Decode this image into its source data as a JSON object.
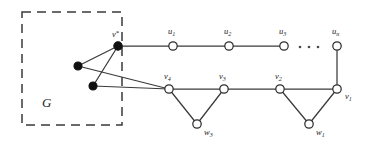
{
  "figure": {
    "background_color": "#ffffff",
    "stroke_color": "#3a3a3a",
    "filled_node_color": "#111111",
    "open_node_color": "#ffffff"
  },
  "box": {
    "label": "G",
    "style": "dashed",
    "x": 22,
    "y": 12,
    "width": 100,
    "height": 113
  },
  "labels": {
    "v_star": "v",
    "v_star_sup": "*",
    "u1": "u",
    "u1_sub": "1",
    "u2": "u",
    "u2_sub": "2",
    "u3": "u",
    "u3_sub": "3",
    "un": "u",
    "un_sub": "n",
    "v1": "v",
    "v1_sub": "1",
    "v2": "v",
    "v2_sub": "2",
    "v3": "v",
    "v3_sub": "3",
    "v4": "v",
    "v4_sub": "4",
    "w1": "w",
    "w1_sub": "1",
    "w3": "w",
    "w3_sub": "3",
    "ellipsis": "..."
  },
  "graph_data": {
    "type": "node-link-diagram",
    "nodes": [
      {
        "id": "g1",
        "label": "",
        "x": 78,
        "y": 66,
        "fill": "solid",
        "r": 4.0
      },
      {
        "id": "g2",
        "label": "",
        "x": 93,
        "y": 86,
        "fill": "solid",
        "r": 4.0
      },
      {
        "id": "v_star",
        "label": "v*",
        "x": 118,
        "y": 46,
        "fill": "solid",
        "r": 4.2
      },
      {
        "id": "u1",
        "label": "u1",
        "x": 173,
        "y": 46,
        "fill": "open",
        "r": 4.2
      },
      {
        "id": "u2",
        "label": "u2",
        "x": 229,
        "y": 46,
        "fill": "open",
        "r": 4.2
      },
      {
        "id": "u3",
        "label": "u3",
        "x": 284,
        "y": 46,
        "fill": "open",
        "r": 4.2
      },
      {
        "id": "un",
        "label": "un",
        "x": 337,
        "y": 46,
        "fill": "open",
        "r": 4.2
      },
      {
        "id": "v4",
        "label": "v4",
        "x": 169,
        "y": 89,
        "fill": "open",
        "r": 4.2
      },
      {
        "id": "v3",
        "label": "v3",
        "x": 224,
        "y": 89,
        "fill": "open",
        "r": 4.2
      },
      {
        "id": "v2",
        "label": "v2",
        "x": 280,
        "y": 89,
        "fill": "open",
        "r": 4.2
      },
      {
        "id": "v1",
        "label": "v1",
        "x": 337,
        "y": 89,
        "fill": "open",
        "r": 4.2
      },
      {
        "id": "w3",
        "label": "w3",
        "x": 197,
        "y": 124,
        "fill": "open",
        "r": 4.2
      },
      {
        "id": "w1",
        "label": "w1",
        "x": 309,
        "y": 124,
        "fill": "open",
        "r": 4.2
      }
    ],
    "edges": [
      [
        "v_star",
        "g1"
      ],
      [
        "v_star",
        "g2"
      ],
      [
        "g1",
        "v4"
      ],
      [
        "g2",
        "v4"
      ],
      [
        "v_star",
        "u1"
      ],
      [
        "u1",
        "u2"
      ],
      [
        "u2",
        "u3"
      ],
      [
        "un",
        "v1"
      ],
      [
        "v4",
        "v3"
      ],
      [
        "v3",
        "v2"
      ],
      [
        "v2",
        "v1"
      ],
      [
        "v4",
        "w3"
      ],
      [
        "w3",
        "v3"
      ],
      [
        "v2",
        "w1"
      ],
      [
        "w1",
        "v1"
      ]
    ],
    "ellipsis_dots": [
      {
        "x": 300,
        "y": 47
      },
      {
        "x": 309,
        "y": 47
      },
      {
        "x": 318,
        "y": 47
      }
    ]
  }
}
